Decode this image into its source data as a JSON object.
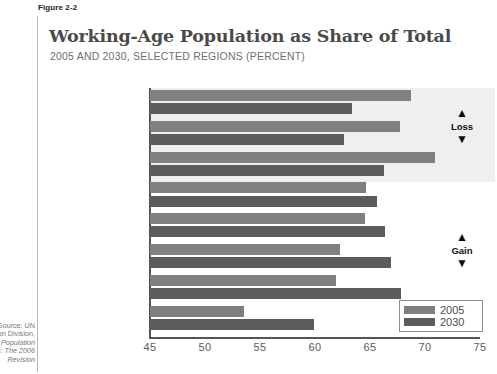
{
  "figure": {
    "label": "Figure 2-2",
    "title": "Working-Age Population as Share of Total",
    "subtitle": "2005 AND 2030, SELECTED REGIONS (PERCENT)"
  },
  "annotations": {
    "loss": {
      "label": "Loss",
      "up": "▲",
      "down": "▼"
    },
    "gain": {
      "label": "Gain",
      "up": "▲",
      "down": "▼"
    }
  },
  "legend": {
    "items": [
      {
        "label": "2005",
        "color": "#808080"
      },
      {
        "label": "2030",
        "color": "#5c5c5c"
      }
    ]
  },
  "source": {
    "line1": "Source: UN",
    "line2": "tion Division,",
    "line3": "ld Population",
    "line4": "ts: The 2006",
    "line5": "Revision"
  },
  "chart_data": {
    "type": "bar",
    "orientation": "horizontal",
    "title": "Working-Age Population as Share of Total",
    "subtitle": "2005 AND 2030, SELECTED REGIONS (PERCENT)",
    "xlabel": "",
    "ylabel": "",
    "xlim": [
      45,
      75
    ],
    "xticks": [
      45,
      50,
      55,
      60,
      65,
      70,
      75
    ],
    "grid": false,
    "legend_position": "bottom-right",
    "categories": [
      "Europe",
      "Northern America",
      "East Asia",
      "World",
      "South America",
      "MENA",
      "South Central Asia",
      "Sub-Saharan Africa"
    ],
    "series": [
      {
        "name": "2005",
        "color": "#808080",
        "values": [
          68.7,
          67.7,
          70.9,
          64.6,
          64.5,
          62.3,
          61.9,
          53.5
        ]
      },
      {
        "name": "2030",
        "color": "#5c5c5c",
        "values": [
          63.4,
          62.6,
          66.3,
          65.6,
          66.4,
          66.9,
          67.8,
          59.9
        ]
      }
    ],
    "annotations": [
      {
        "text": "Loss",
        "applies_to": [
          "Europe",
          "Northern America",
          "East Asia"
        ]
      },
      {
        "text": "Gain",
        "applies_to": [
          "World",
          "South America",
          "MENA",
          "South Central Asia",
          "Sub-Saharan Africa"
        ]
      }
    ]
  }
}
